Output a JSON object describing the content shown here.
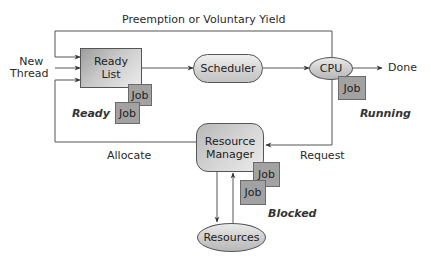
{
  "diagram": {
    "title_edge": "Preemption or Voluntary Yield",
    "entry_label": [
      "New",
      "Thread"
    ],
    "nodes": {
      "ready_list": [
        "Ready",
        "List"
      ],
      "scheduler": "Scheduler",
      "cpu": "CPU",
      "resource_manager": [
        "Resource",
        "Manager"
      ],
      "resources": "Resources"
    },
    "jobs": {
      "ready": [
        "Job",
        "Job"
      ],
      "running": [
        "Job"
      ],
      "blocked": [
        "Job",
        "Job"
      ]
    },
    "states": {
      "ready": "Ready",
      "running": "Running",
      "blocked": "Blocked"
    },
    "edges": {
      "allocate": "Allocate",
      "request": "Request",
      "done": "Done"
    },
    "colors": {
      "line": "#555555",
      "job_fill": "#a2a2a2",
      "node_fill": "#d0d0d0"
    }
  }
}
